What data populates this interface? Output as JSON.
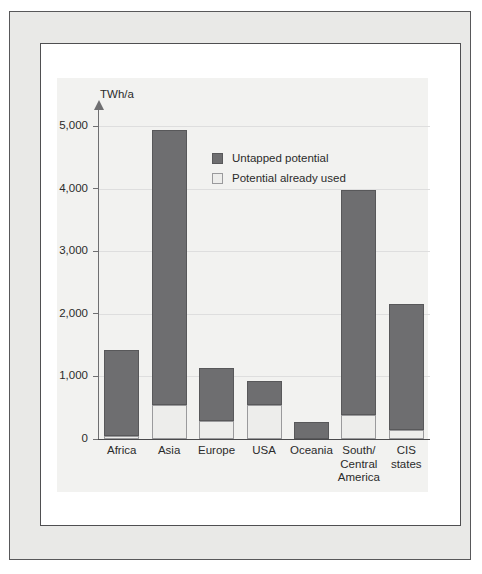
{
  "chart_data": {
    "type": "bar",
    "title": "",
    "subtitle": "",
    "xlabel": "",
    "ylabel": "TWh/a",
    "unit_label": "TWh/a",
    "stacked": true,
    "grid": true,
    "legend_position": "inside-top-center",
    "ylim": [
      0,
      5300
    ],
    "yticks": [
      0,
      1000,
      2000,
      3000,
      4000,
      5000
    ],
    "ytick_labels": [
      "0",
      "1,000",
      "2,000",
      "3,000",
      "4,000",
      "5,000"
    ],
    "categories": [
      "Africa",
      "Asia",
      "Europe",
      "USA",
      "Oceania",
      "South/\nCentral\nAmerica",
      "CIS\nstates"
    ],
    "category_labels": [
      [
        "Africa"
      ],
      [
        "Asia"
      ],
      [
        "Europe"
      ],
      [
        "USA"
      ],
      [
        "Oceania"
      ],
      [
        "South/",
        "Central",
        "America"
      ],
      [
        "CIS",
        "states"
      ]
    ],
    "series": [
      {
        "name": "Potential already used",
        "color": "#ededeb",
        "values": [
          40,
          540,
          290,
          550,
          0,
          385,
          150
        ]
      },
      {
        "name": "Untapped potential",
        "color": "#6e6e70",
        "values": [
          1380,
          4400,
          840,
          375,
          270,
          3595,
          2000
        ]
      }
    ],
    "totals": [
      1420,
      4940,
      1130,
      925,
      270,
      3980,
      2150
    ],
    "legend": [
      {
        "label": "Untapped potential",
        "swatch": "dark"
      },
      {
        "label": "Potential already used",
        "swatch": "light"
      }
    ],
    "colors": {
      "untapped": "#6e6e70",
      "already_used": "#ededeb",
      "panel_background": "#f2f2f0",
      "gridline": "#dedede",
      "axis": "#6f6f71",
      "text": "#2b2b2b"
    }
  }
}
